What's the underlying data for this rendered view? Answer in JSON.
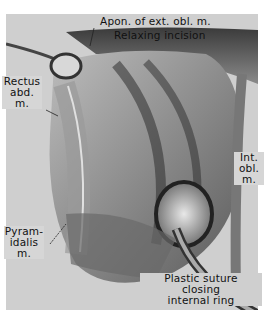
{
  "figure": {
    "type": "anatomical surgical illustration",
    "labels": {
      "apon_ext_obl": "Apon. of ext. obl. m.",
      "relaxing_incision": "Relaxing incision",
      "rectus_1": "Rectus",
      "rectus_2": "abd.",
      "rectus_3": "m.",
      "int_obl_1": "Int.",
      "int_obl_2": "obl.",
      "int_obl_3": "m.",
      "pyram_1": "Pyram-",
      "pyram_2": "idalis",
      "pyram_3": "m.",
      "suture_1": "Plastic suture",
      "suture_2": "closing",
      "suture_3": "internal ring"
    }
  }
}
